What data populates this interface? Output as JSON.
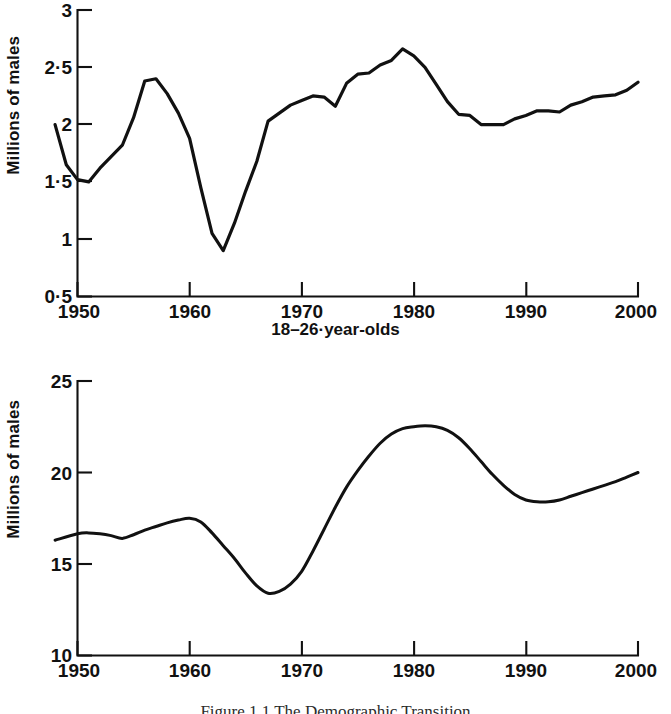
{
  "figure": {
    "caption": "Figure 1.1   The Demographic Transition"
  },
  "panels": [
    {
      "id": "top",
      "ylabel": "Millions of males",
      "xlabel": "18–26·year-olds",
      "yticks": [
        "0·5",
        "1",
        "1·5",
        "2",
        "2·5",
        "3"
      ],
      "xticks": [
        "1950",
        "1960",
        "1970",
        "1980",
        "1990",
        "2000"
      ]
    },
    {
      "id": "bottom",
      "ylabel": "Millions of males",
      "xlabel": "",
      "yticks": [
        "10",
        "15",
        "20",
        "25"
      ],
      "xticks": [
        "1950",
        "1960",
        "1970",
        "1980",
        "1990",
        "2000"
      ]
    }
  ],
  "chart_data": [
    {
      "type": "line",
      "id": "top-chart",
      "title": "",
      "xlabel": "18–26·year-olds",
      "ylabel": "Millions of males",
      "xlim": [
        1948,
        2000
      ],
      "ylim": [
        0.5,
        3
      ],
      "ytick_values": [
        0.5,
        1,
        1.5,
        2,
        2.5,
        3
      ],
      "ytick_labels": [
        "0·5",
        "1",
        "1·5",
        "2",
        "2·5",
        "3"
      ],
      "xtick_values": [
        1950,
        1960,
        1970,
        1980,
        1990,
        2000
      ],
      "xtick_labels": [
        "1950",
        "1960",
        "1970",
        "1980",
        "1990",
        "2000"
      ],
      "grid": false,
      "legend": "none",
      "interpolation": "linear",
      "x": [
        1948,
        1949,
        1950,
        1951,
        1952,
        1953,
        1954,
        1955,
        1956,
        1957,
        1958,
        1959,
        1960,
        1961,
        1962,
        1963,
        1964,
        1965,
        1966,
        1967,
        1968,
        1969,
        1970,
        1971,
        1972,
        1973,
        1974,
        1975,
        1976,
        1977,
        1978,
        1979,
        1980,
        1981,
        1982,
        1983,
        1984,
        1985,
        1986,
        1987,
        1988,
        1989,
        1990,
        1991,
        1992,
        1993,
        1994,
        1995,
        1996,
        1997,
        1998,
        1999,
        2000
      ],
      "y": [
        2.0,
        1.65,
        1.52,
        1.5,
        1.62,
        1.72,
        1.82,
        2.06,
        2.38,
        2.4,
        2.27,
        2.1,
        1.88,
        1.45,
        1.05,
        0.9,
        1.14,
        1.42,
        1.68,
        2.03,
        2.1,
        2.17,
        2.21,
        2.25,
        2.24,
        2.16,
        2.36,
        2.44,
        2.45,
        2.52,
        2.56,
        2.66,
        2.6,
        2.5,
        2.35,
        2.2,
        2.09,
        2.08,
        2.0,
        2.0,
        2.0,
        2.05,
        2.08,
        2.12,
        2.12,
        2.11,
        2.17,
        2.2,
        2.24,
        2.25,
        2.26,
        2.3,
        2.37
      ],
      "series": [
        {
          "name": "18-26-year-old males",
          "values": [
            2.0,
            1.65,
            1.52,
            1.5,
            1.62,
            1.72,
            1.82,
            2.06,
            2.38,
            2.4,
            2.27,
            2.1,
            1.88,
            1.45,
            1.05,
            0.9,
            1.14,
            1.42,
            1.68,
            2.03,
            2.1,
            2.17,
            2.21,
            2.25,
            2.24,
            2.16,
            2.36,
            2.44,
            2.45,
            2.52,
            2.56,
            2.66,
            2.6,
            2.5,
            2.35,
            2.2,
            2.09,
            2.08,
            2.0,
            2.0,
            2.0,
            2.05,
            2.08,
            2.12,
            2.12,
            2.11,
            2.17,
            2.2,
            2.24,
            2.25,
            2.26,
            2.3,
            2.37
          ]
        }
      ],
      "annotations": {
        "peak_1957": 2.4,
        "trough_1963": 0.9,
        "peak_1979": 2.66,
        "plateau_1986_1988": 2.0,
        "end_2000": 2.37
      }
    },
    {
      "type": "line",
      "id": "bottom-chart",
      "title": "",
      "xlabel": "",
      "ylabel": "Millions of males",
      "xlim": [
        1948,
        2000
      ],
      "ylim": [
        10,
        25
      ],
      "ytick_values": [
        10,
        15,
        20,
        25
      ],
      "ytick_labels": [
        "10",
        "15",
        "20",
        "25"
      ],
      "xtick_values": [
        1950,
        1960,
        1970,
        1980,
        1990,
        2000
      ],
      "xtick_labels": [
        "1950",
        "1960",
        "1970",
        "1980",
        "1990",
        "2000"
      ],
      "grid": false,
      "legend": "none",
      "interpolation": "smooth",
      "x": [
        1948,
        1950,
        1951,
        1952,
        1953,
        1954,
        1955,
        1956,
        1957,
        1958,
        1959,
        1960,
        1961,
        1962,
        1963,
        1964,
        1965,
        1966,
        1967,
        1968,
        1969,
        1970,
        1971,
        1972,
        1973,
        1974,
        1975,
        1976,
        1977,
        1978,
        1979,
        1980,
        1981,
        1982,
        1983,
        1984,
        1985,
        1986,
        1987,
        1988,
        1989,
        1990,
        1991,
        1992,
        1993,
        1994,
        1995,
        1996,
        1997,
        1998,
        1999,
        2000
      ],
      "y": [
        16.3,
        16.65,
        16.7,
        16.65,
        16.55,
        16.4,
        16.6,
        16.85,
        17.05,
        17.25,
        17.4,
        17.5,
        17.3,
        16.7,
        16.0,
        15.3,
        14.5,
        13.8,
        13.4,
        13.5,
        13.9,
        14.6,
        15.7,
        16.9,
        18.1,
        19.2,
        20.1,
        20.9,
        21.6,
        22.1,
        22.4,
        22.5,
        22.55,
        22.5,
        22.3,
        21.9,
        21.3,
        20.6,
        19.9,
        19.3,
        18.8,
        18.5,
        18.4,
        18.4,
        18.5,
        18.7,
        18.9,
        19.1,
        19.3,
        19.5,
        19.75,
        20.0
      ],
      "series": [
        {
          "name": "males (all ages group)",
          "values": [
            16.3,
            16.65,
            16.7,
            16.65,
            16.55,
            16.4,
            16.6,
            16.85,
            17.05,
            17.25,
            17.4,
            17.5,
            17.3,
            16.7,
            16.0,
            15.3,
            14.5,
            13.8,
            13.4,
            13.5,
            13.9,
            14.6,
            15.7,
            16.9,
            18.1,
            19.2,
            20.1,
            20.9,
            21.6,
            22.1,
            22.4,
            22.5,
            22.55,
            22.5,
            22.3,
            21.9,
            21.3,
            20.6,
            19.9,
            19.3,
            18.8,
            18.5,
            18.4,
            18.4,
            18.5,
            18.7,
            18.9,
            19.1,
            19.3,
            19.5,
            19.75,
            20.0
          ]
        }
      ],
      "annotations": {
        "start_1948": 16.3,
        "local_peak_1960": 17.5,
        "trough_1967": 13.4,
        "peak_1981": 22.55,
        "local_min_1992": 18.4,
        "end_2000": 20.0
      }
    }
  ]
}
